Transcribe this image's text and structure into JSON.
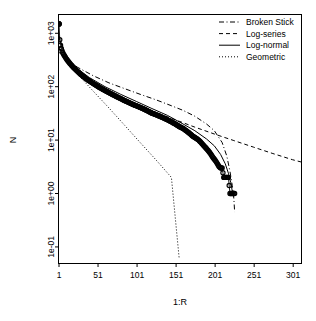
{
  "chart_data": {
    "type": "line",
    "title": "",
    "subtitle": "",
    "xlabel": "1:R",
    "ylabel": "N",
    "xlim": [
      1,
      311
    ],
    "ylim": [
      0.05,
      2200
    ],
    "yscale": "log",
    "xscale": "linear",
    "grid": false,
    "box": true,
    "legend_position": "top-right",
    "xticks": [
      1,
      51,
      101,
      151,
      201,
      251,
      301
    ],
    "xtick_labels": [
      "1",
      "51",
      "101",
      "151",
      "201",
      "251",
      "301"
    ],
    "yticks": [
      1000,
      100,
      10,
      1,
      0.1
    ],
    "ytick_labels": [
      "1e+03",
      "1e+02",
      "1e+01",
      "1e+00",
      "1e-01"
    ],
    "legend": [
      {
        "label": "Broken Stick",
        "style": "dashdot",
        "color": "#000000"
      },
      {
        "label": "Log-series",
        "style": "dashed",
        "color": "#000000"
      },
      {
        "label": "Log-normal",
        "style": "solid",
        "color": "#000000"
      },
      {
        "label": "Geometric",
        "style": "dotted",
        "color": "#000000"
      }
    ],
    "series": [
      {
        "name": "Observed",
        "style": "points-line",
        "marker": "circle",
        "color": "#000000",
        "x": [
          1,
          2,
          3,
          4,
          5,
          6,
          7,
          8,
          9,
          10,
          12,
          14,
          16,
          18,
          20,
          23,
          26,
          29,
          32,
          35,
          38,
          42,
          46,
          50,
          54,
          58,
          62,
          66,
          70,
          75,
          80,
          85,
          90,
          95,
          100,
          105,
          110,
          115,
          120,
          125,
          130,
          135,
          140,
          145,
          150,
          155,
          160,
          164,
          168,
          172,
          176,
          180,
          183,
          186,
          189,
          192,
          195,
          198,
          200,
          202,
          204,
          206,
          208,
          210,
          212,
          214,
          216,
          218,
          220,
          222,
          224,
          226
        ],
        "y": [
          1500,
          760,
          600,
          520,
          470,
          430,
          400,
          380,
          360,
          340,
          310,
          285,
          262,
          243,
          226,
          205,
          186,
          170,
          156,
          144,
          134,
          122,
          112,
          103,
          95,
          88,
          82,
          76,
          71,
          65,
          60,
          55,
          51,
          47,
          44,
          41,
          38,
          35,
          32,
          30,
          28,
          26,
          24,
          22,
          20,
          18,
          16.5,
          15,
          13.5,
          12,
          11,
          10,
          9,
          8,
          7.2,
          6.4,
          5.6,
          4.8,
          4.4,
          4,
          3.6,
          3.2,
          3,
          3,
          2,
          2,
          2,
          2,
          1,
          1,
          1,
          1
        ]
      },
      {
        "name": "Broken Stick",
        "style": "dashdot",
        "color": "#000000",
        "x": [
          1,
          10,
          25,
          45,
          65,
          85,
          105,
          125,
          145,
          160,
          175,
          190,
          200,
          210,
          216,
          220,
          223,
          225,
          226
        ],
        "y": [
          440,
          330,
          230,
          160,
          118,
          92,
          72,
          57,
          44,
          36,
          28,
          20,
          15,
          9,
          5,
          2.6,
          1.4,
          0.8,
          0.45
        ]
      },
      {
        "name": "Log-series",
        "style": "dashed",
        "color": "#000000",
        "x": [
          1,
          10,
          25,
          50,
          75,
          100,
          125,
          150,
          175,
          200,
          225,
          250,
          275,
          300,
          311
        ],
        "y": [
          900,
          330,
          190,
          105,
          68,
          47,
          33,
          24,
          17.5,
          13,
          9.8,
          7.4,
          5.6,
          4.3,
          3.9
        ]
      },
      {
        "name": "Log-normal",
        "style": "solid",
        "color": "#000000",
        "x": [
          1,
          8,
          20,
          40,
          60,
          80,
          100,
          120,
          140,
          160,
          175,
          190,
          200,
          208,
          214,
          218,
          221,
          223
        ],
        "y": [
          820,
          430,
          245,
          148,
          100,
          72,
          53,
          39,
          29,
          20,
          15,
          10.5,
          7.8,
          5.4,
          3.6,
          2.4,
          1.6,
          1.1
        ]
      },
      {
        "name": "Geometric",
        "style": "dotted",
        "color": "#000000",
        "x": [
          1,
          10,
          25,
          45,
          65,
          85,
          105,
          125,
          145,
          155
        ],
        "y": [
          560,
          330,
          170,
          82,
          40,
          19,
          9,
          4.3,
          2.0,
          0.06
        ]
      }
    ]
  },
  "axes": {
    "y_label": "N",
    "x_label": "1:R"
  }
}
